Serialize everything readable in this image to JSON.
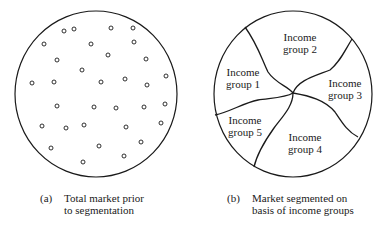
{
  "panel_a": {
    "caption_tag": "(a)",
    "caption_line1": "Total market prior",
    "caption_line2": "to segmentation",
    "dots": [
      [
        64,
        31
      ],
      [
        74,
        29
      ],
      [
        111,
        28
      ],
      [
        133,
        28
      ],
      [
        44,
        44
      ],
      [
        91,
        44
      ],
      [
        134,
        42
      ],
      [
        57,
        60
      ],
      [
        108,
        55
      ],
      [
        146,
        59
      ],
      [
        82,
        70
      ],
      [
        32,
        83
      ],
      [
        54,
        82
      ],
      [
        101,
        82
      ],
      [
        125,
        79
      ],
      [
        147,
        85
      ],
      [
        166,
        76
      ],
      [
        57,
        106
      ],
      [
        94,
        107
      ],
      [
        116,
        108
      ],
      [
        144,
        107
      ],
      [
        165,
        104
      ],
      [
        42,
        126
      ],
      [
        66,
        128
      ],
      [
        84,
        125
      ],
      [
        126,
        127
      ],
      [
        161,
        123
      ],
      [
        51,
        148
      ],
      [
        99,
        146
      ],
      [
        141,
        142
      ],
      [
        124,
        156
      ],
      [
        83,
        162
      ]
    ]
  },
  "panel_b": {
    "caption_tag": "(b)",
    "caption_line1": "Market segmented on",
    "caption_line2": "basis of income groups",
    "segments": [
      {
        "line1": "Income",
        "line2": "group 1"
      },
      {
        "line1": "Income",
        "line2": "group 2"
      },
      {
        "line1": "Income",
        "line2": "group 3"
      },
      {
        "line1": "Income",
        "line2": "group 4"
      },
      {
        "line1": "Income",
        "line2": "group 5"
      }
    ]
  },
  "colors": {
    "stroke": "#1a1a1a",
    "background": "#ffffff"
  }
}
